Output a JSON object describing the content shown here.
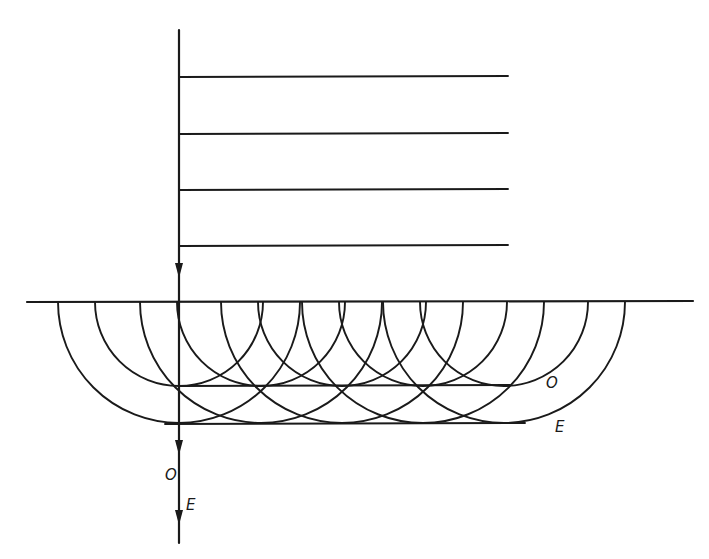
{
  "figure": {
    "colors": {
      "ink": "#1a1a1a",
      "background": "#ffffff"
    },
    "incident_ray": {
      "x": 179,
      "y_start": 30,
      "y_end": 302,
      "arrow_y": 275
    },
    "incident_wavefronts": {
      "x_start": 180,
      "x_end": 508,
      "y": [
        77,
        134,
        190,
        246
      ]
    },
    "interface": {
      "y": 302,
      "x_start": 27,
      "x_end": 693
    },
    "wavelets": {
      "centers_x": [
        179,
        261,
        342,
        423,
        504
      ],
      "radius_ordinary": 84,
      "radius_extraordinary": 121
    },
    "envelopes": {
      "ordinary": {
        "y": 386,
        "x_start": 179,
        "x_end": 510,
        "label": "O"
      },
      "extraordinary": {
        "y": 424,
        "x_start": 165,
        "x_end": 525,
        "label": "E"
      }
    },
    "refracted_ray": {
      "x": 179,
      "y_start": 302,
      "y_end": 543,
      "arrows_y": [
        452,
        522
      ],
      "labels": [
        {
          "text": "O",
          "x": 169,
          "y": 480
        },
        {
          "text": "E",
          "x": 186,
          "y": 510
        }
      ]
    }
  }
}
